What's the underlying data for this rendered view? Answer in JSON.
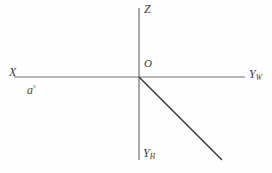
{
  "diagram": {
    "background_color": "#fefefe",
    "axis_color": "#6e6e6e",
    "ray_color": "#2b2b2b",
    "label_color": "#3a3a3a",
    "labels": {
      "z_axis": "Z",
      "origin": "O",
      "x_axis": "X",
      "y_w_base": "Y",
      "y_w_subscript": "W",
      "y_h_base": "Y",
      "y_h_subscript": "H",
      "angle_base": "a",
      "angle_degree": "°"
    },
    "geometry": {
      "origin": {
        "x": 139,
        "y": 77
      },
      "vertical_axis": {
        "x": 139,
        "y_top": 8,
        "y_bottom": 160
      },
      "horizontal_axis": {
        "y": 77,
        "x_left": 14,
        "x_right": 245
      },
      "ray": {
        "x1": 139,
        "y1": 77,
        "x2": 222,
        "y2": 160
      }
    }
  }
}
